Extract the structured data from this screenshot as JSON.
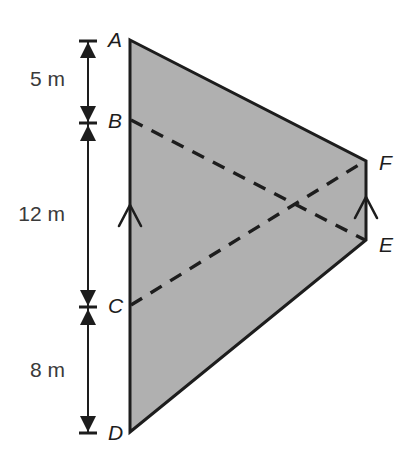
{
  "figure": {
    "background_color": "#ffffff",
    "fill_color": "#b0b0b0",
    "stroke_color": "#1d1d1d",
    "dash_color": "#1d1d1d"
  },
  "vertices": [
    {
      "id": "A",
      "label": "A",
      "x": 130,
      "y": 40
    },
    {
      "id": "B",
      "label": "B",
      "x": 130,
      "y": 120
    },
    {
      "id": "C",
      "label": "C",
      "x": 130,
      "y": 305
    },
    {
      "id": "D",
      "label": "D",
      "x": 130,
      "y": 432
    },
    {
      "id": "E",
      "label": "E",
      "x": 366,
      "y": 240
    },
    {
      "id": "F",
      "label": "F",
      "x": 366,
      "y": 161
    }
  ],
  "labels": {
    "A": "A",
    "B": "B",
    "C": "C",
    "D": "D",
    "E": "E",
    "F": "F"
  },
  "dimensions": [
    {
      "id": "AB",
      "label": "5 m",
      "value": 5,
      "unit": "m",
      "from": "A",
      "to": "B",
      "y_center": 79
    },
    {
      "id": "BC",
      "label": "12 m",
      "value": 12,
      "unit": "m",
      "from": "B",
      "to": "C",
      "y_center": 213
    },
    {
      "id": "CD",
      "label": "8 m",
      "value": 8,
      "unit": "m",
      "from": "C",
      "to": "D",
      "y_center": 369
    }
  ],
  "dimension_line": {
    "x": 88,
    "top": 40,
    "bottom": 432,
    "tick_half_width": 9
  },
  "dashed_segments": [
    {
      "id": "BE",
      "from": "B",
      "to": "E"
    },
    {
      "id": "CF",
      "from": "C",
      "to": "F"
    }
  ],
  "parallel_marks": [
    {
      "id": "mark-AD",
      "on": "AD",
      "x": 130,
      "y": 213
    },
    {
      "id": "mark-FE",
      "on": "FE",
      "x": 366,
      "y": 205
    }
  ],
  "outline_path": "M130,40 L366,161 L366,240 L130,432 Z"
}
